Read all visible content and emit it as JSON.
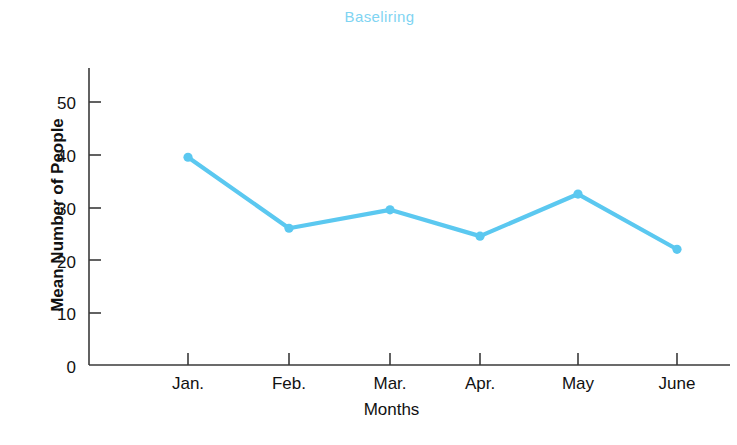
{
  "chart_data": {
    "type": "line",
    "title": "Baseliring",
    "xlabel": "Months",
    "ylabel": "Mean Number of People",
    "categories": [
      "Jan.",
      "Feb.",
      "Mar.",
      "Apr.",
      "May",
      "June"
    ],
    "values": [
      39.5,
      26,
      29.5,
      24.5,
      32.5,
      22
    ],
    "series": [
      {
        "name": "Mean Number of People",
        "values": [
          39.5,
          26,
          29.5,
          24.5,
          32.5,
          22
        ]
      }
    ],
    "ylim": [
      0,
      55
    ],
    "yticks": [
      0,
      10,
      20,
      30,
      40,
      50
    ],
    "ytick_labels": [
      "0",
      "10",
      "20",
      "30",
      "40",
      "50"
    ],
    "xtick_labels": [
      "Jan.",
      "Feb.",
      "Mar.",
      "Apr.",
      "May",
      "June"
    ],
    "grid": false,
    "legend": false,
    "legend_position": "none",
    "line_color": "#5bc8f0",
    "marker_color": "#5bc8f0",
    "title_color": "#7fd4f2",
    "axis_color": "#3a3a3a",
    "text_color": "#111111"
  },
  "axis": {
    "ytick_0": "0",
    "ytick_10": "10",
    "ytick_20": "20",
    "ytick_30": "30",
    "ytick_40": "40",
    "ytick_50": "50",
    "xtick_jan": "Jan.",
    "xtick_feb": "Feb.",
    "xtick_mar": "Mar.",
    "xtick_apr": "Apr.",
    "xtick_may": "May",
    "xtick_june": "June"
  }
}
